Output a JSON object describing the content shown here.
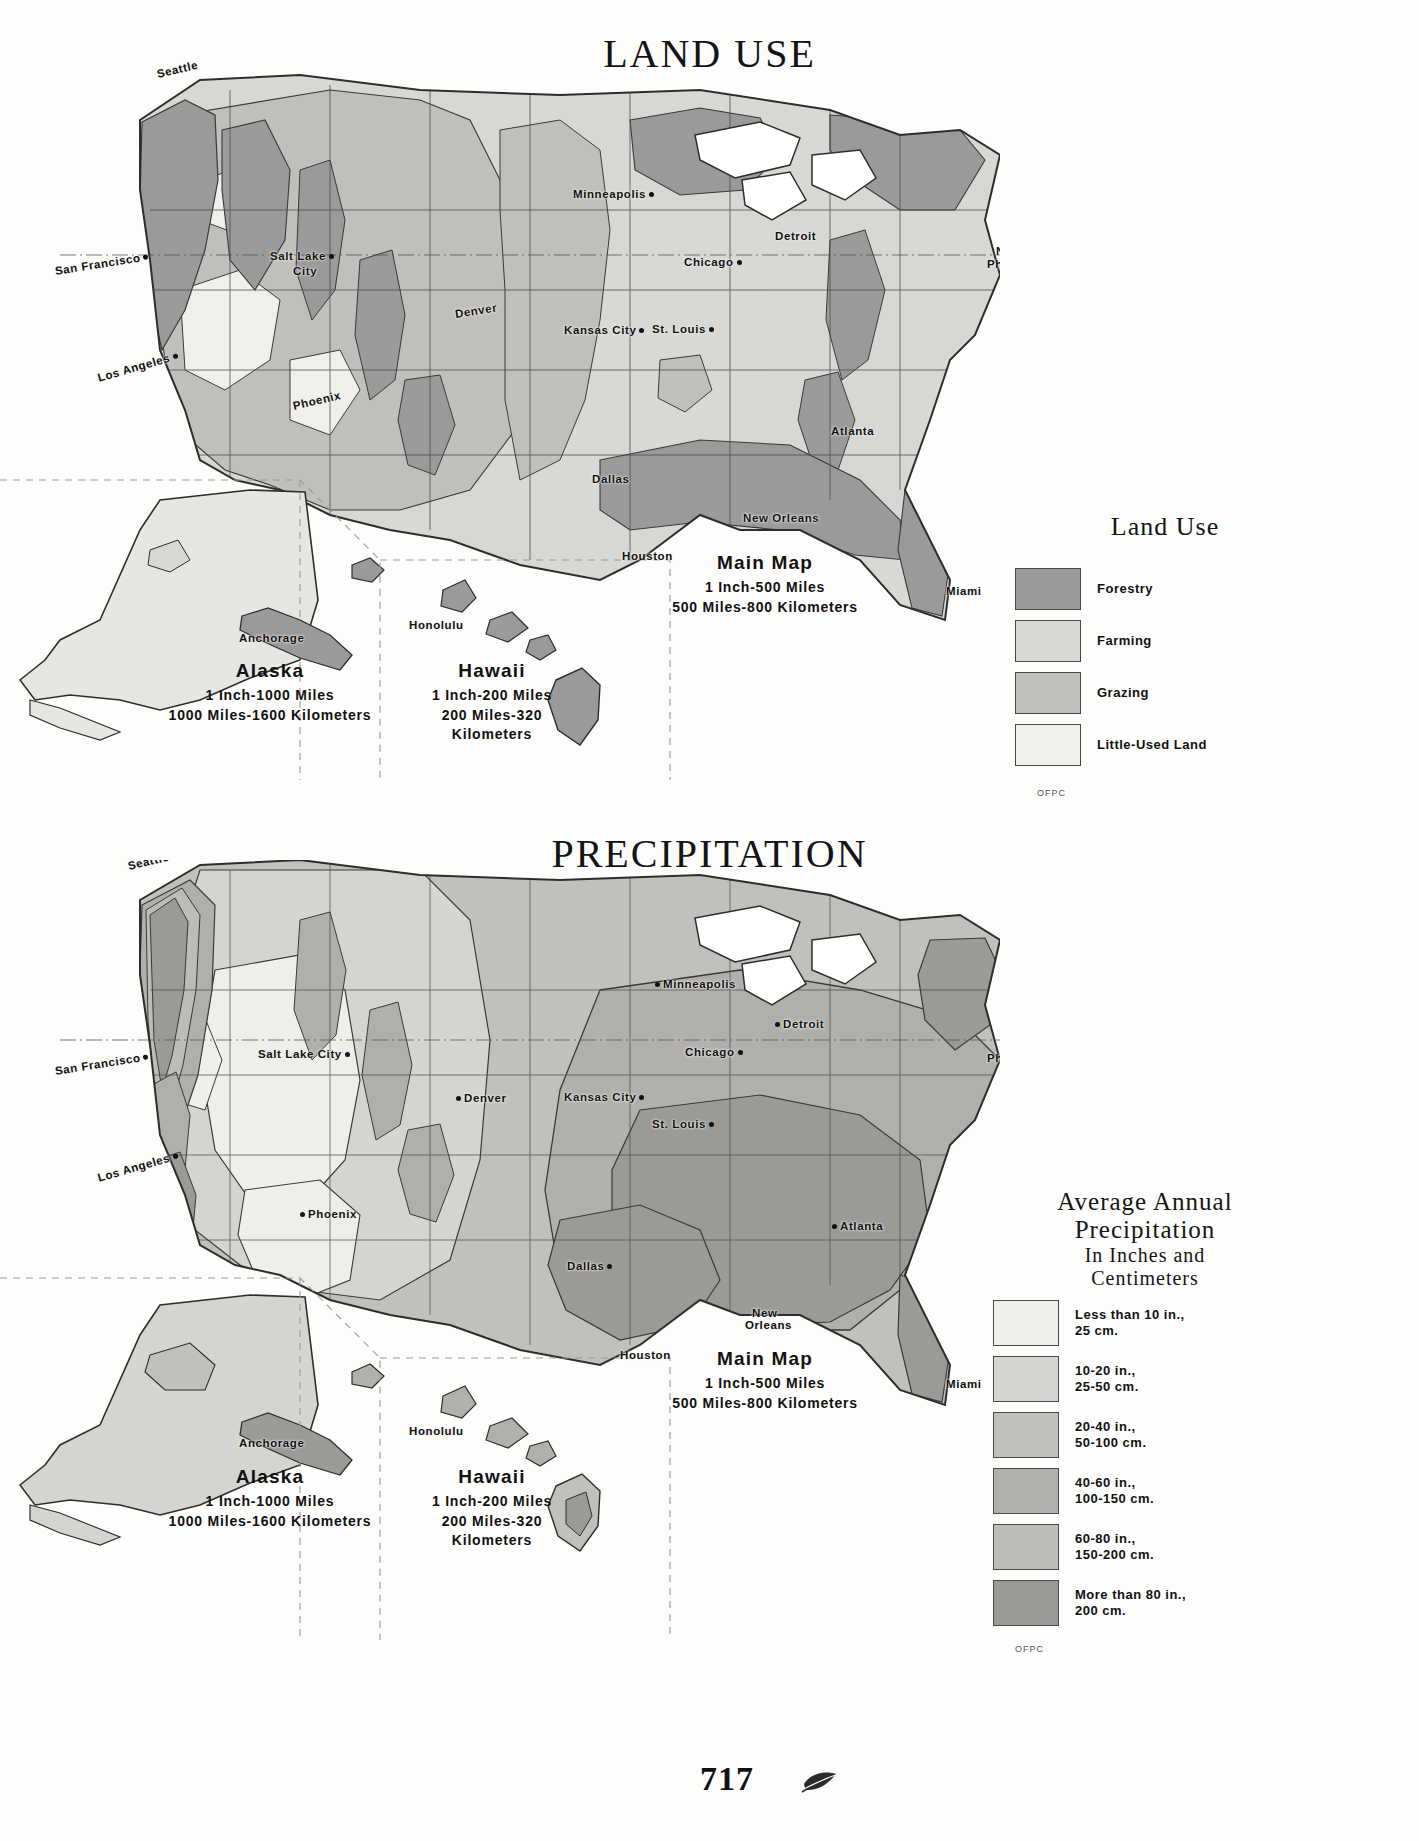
{
  "page": {
    "number": "717",
    "printer_mark": "leaf-flourish"
  },
  "maps": [
    {
      "id": "land-use",
      "title": "LAND USE",
      "main_scale": {
        "heading": "Main Map",
        "line1": "1 Inch-500 Miles",
        "line2": "500 Miles-800 Kilometers"
      },
      "insets": [
        {
          "name": "Alaska",
          "line1": "1 Inch-1000 Miles",
          "line2": "1000 Miles-1600 Kilometers"
        },
        {
          "name": "Hawaii",
          "line1": "1 Inch-200 Miles",
          "line2": "200 Miles-320",
          "line3": "Kilometers"
        }
      ],
      "legend": {
        "title": "Land Use",
        "credit": "OFPC",
        "entries": [
          {
            "label": "Forestry",
            "color": "#9a9a9a"
          },
          {
            "label": "Farming",
            "color": "#d8d8d4"
          },
          {
            "label": "Grazing",
            "color": "#bfbfbc"
          },
          {
            "label": "Little-Used Land",
            "color": "#efefec"
          }
        ]
      },
      "cities": [
        {
          "name": "Seattle",
          "x": 157,
          "y": 8,
          "rot": "rot-b",
          "dot": "none"
        },
        {
          "name": "San Francisco",
          "x": 55,
          "y": 205,
          "rot": "rot-c",
          "dot": "after"
        },
        {
          "name": "Los Angeles",
          "x": 98,
          "y": 312,
          "rot": "rot-a",
          "dot": "after"
        },
        {
          "name": "Salt Lake",
          "x": 270,
          "y": 190,
          "rot": "none",
          "dot": "after"
        },
        {
          "name": "City",
          "x": 293,
          "y": 205,
          "rot": "none",
          "dot": "none"
        },
        {
          "name": "Phoenix",
          "x": 293,
          "y": 340,
          "rot": "rot-b",
          "dot": "none"
        },
        {
          "name": "Denver",
          "x": 455,
          "y": 248,
          "rot": "rot-c",
          "dot": "none"
        },
        {
          "name": "Minneapolis",
          "x": 573,
          "y": 128,
          "rot": "none",
          "dot": "after"
        },
        {
          "name": "Kansas City",
          "x": 564,
          "y": 264,
          "rot": "none",
          "dot": "after"
        },
        {
          "name": "St. Louis",
          "x": 652,
          "y": 263,
          "rot": "none",
          "dot": "after"
        },
        {
          "name": "Chicago",
          "x": 684,
          "y": 196,
          "rot": "none",
          "dot": "after"
        },
        {
          "name": "Detroit",
          "x": 775,
          "y": 170,
          "rot": "none",
          "dot": "none"
        },
        {
          "name": "New York",
          "x": 996,
          "y": 185,
          "rot": "none",
          "dot": "none"
        },
        {
          "name": "Philadelphia",
          "x": 987,
          "y": 198,
          "rot": "none",
          "dot": "none"
        },
        {
          "name": "Atlanta",
          "x": 831,
          "y": 365,
          "rot": "none",
          "dot": "none"
        },
        {
          "name": "Dallas",
          "x": 592,
          "y": 413,
          "rot": "none",
          "dot": "none"
        },
        {
          "name": "Houston",
          "x": 622,
          "y": 490,
          "rot": "none",
          "dot": "none"
        },
        {
          "name": "New Orleans",
          "x": 743,
          "y": 452,
          "rot": "none",
          "dot": "none"
        },
        {
          "name": "Miami",
          "x": 946,
          "y": 525,
          "rot": "none",
          "dot": "none"
        },
        {
          "name": "Anchorage",
          "x": 239,
          "y": 572,
          "rot": "none",
          "dot": "none"
        },
        {
          "name": "Honolulu",
          "x": 409,
          "y": 559,
          "rot": "none",
          "dot": "none"
        }
      ]
    },
    {
      "id": "precipitation",
      "title": "PRECIPITATION",
      "main_scale": {
        "heading": "Main Map",
        "line1": "1 Inch-500 Miles",
        "line2": "500 Miles-800 Kilometers"
      },
      "insets": [
        {
          "name": "Alaska",
          "line1": "1 Inch-1000 Miles",
          "line2": "1000 Miles-1600 Kilometers"
        },
        {
          "name": "Hawaii",
          "line1": "1 Inch-200 Miles",
          "line2": "200 Miles-320",
          "line3": "Kilometers"
        }
      ],
      "legend": {
        "title_line1": "Average Annual",
        "title_line2": "Precipitation",
        "subtitle_line1": "In Inches and",
        "subtitle_line2": "Centimeters",
        "credit": "OFPC",
        "entries": [
          {
            "label": "Less than 10 in.,\n25 cm.",
            "color": "#eeeeea"
          },
          {
            "label": "10-20 in.,\n25-50 cm.",
            "color": "#d4d4d0"
          },
          {
            "label": "20-40 in.,\n50-100 cm.",
            "color": "#c0c0bc"
          },
          {
            "label": "40-60 in.,\n100-150 cm.",
            "color": "#b0b0ac"
          },
          {
            "label": "60-80 in.,\n150-200 cm.",
            "color": "#bcbcb8"
          },
          {
            "label": "More than 80 in.,\n200 cm.",
            "color": "#9a9a96"
          }
        ]
      },
      "cities": [
        {
          "name": "Seattle",
          "x": 128,
          "y": 0,
          "rot": "rot-b",
          "dot": "none"
        },
        {
          "name": "San Francisco",
          "x": 55,
          "y": 205,
          "rot": "rot-c",
          "dot": "after"
        },
        {
          "name": "Los Angeles",
          "x": 98,
          "y": 312,
          "rot": "rot-a",
          "dot": "after"
        },
        {
          "name": "Salt Lake City",
          "x": 258,
          "y": 188,
          "rot": "none",
          "dot": "after"
        },
        {
          "name": "Phoenix",
          "x": 300,
          "y": 348,
          "rot": "none",
          "dot": "before"
        },
        {
          "name": "Denver",
          "x": 456,
          "y": 232,
          "rot": "none",
          "dot": "before"
        },
        {
          "name": "Minneapolis",
          "x": 655,
          "y": 118,
          "rot": "none",
          "dot": "before"
        },
        {
          "name": "Kansas City",
          "x": 564,
          "y": 231,
          "rot": "none",
          "dot": "after"
        },
        {
          "name": "St. Louis",
          "x": 652,
          "y": 258,
          "rot": "none",
          "dot": "after"
        },
        {
          "name": "Chicago",
          "x": 685,
          "y": 186,
          "rot": "none",
          "dot": "after"
        },
        {
          "name": "Detroit",
          "x": 775,
          "y": 158,
          "rot": "none",
          "dot": "before"
        },
        {
          "name": "New York",
          "x": 1008,
          "y": 170,
          "rot": "none",
          "dot": "none"
        },
        {
          "name": "Philadelphia",
          "x": 987,
          "y": 192,
          "rot": "none",
          "dot": "none"
        },
        {
          "name": "Atlanta",
          "x": 832,
          "y": 360,
          "rot": "none",
          "dot": "before"
        },
        {
          "name": "Dallas",
          "x": 567,
          "y": 400,
          "rot": "none",
          "dot": "after"
        },
        {
          "name": "Houston",
          "x": 620,
          "y": 489,
          "rot": "none",
          "dot": "none"
        },
        {
          "name": "New",
          "x": 752,
          "y": 447,
          "rot": "none",
          "dot": "none"
        },
        {
          "name": "Orleans",
          "x": 745,
          "y": 459,
          "rot": "none",
          "dot": "none"
        },
        {
          "name": "Miami",
          "x": 946,
          "y": 518,
          "rot": "none",
          "dot": "none"
        },
        {
          "name": "Anchorage",
          "x": 239,
          "y": 577,
          "rot": "none",
          "dot": "none"
        },
        {
          "name": "Honolulu",
          "x": 409,
          "y": 565,
          "rot": "none",
          "dot": "none"
        }
      ]
    }
  ]
}
